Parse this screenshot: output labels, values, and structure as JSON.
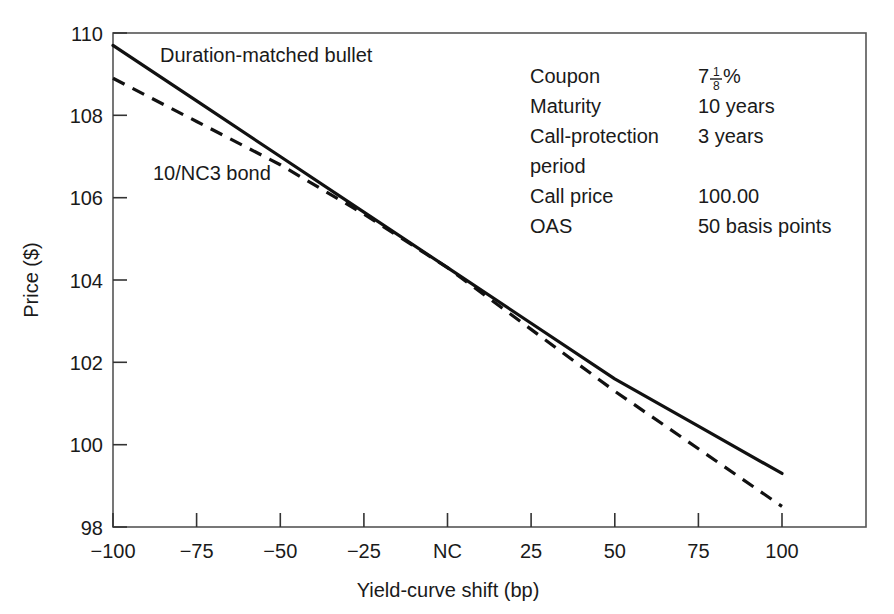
{
  "chart_data": {
    "type": "line",
    "title": "",
    "xlabel": "Yield-curve shift (bp)",
    "ylabel": "Price ($)",
    "xlim": [
      -100,
      100
    ],
    "ylim": [
      98,
      110
    ],
    "grid": false,
    "legend_position": "inline-labels",
    "x_tick_values": [
      -100,
      -75,
      -50,
      -25,
      0,
      25,
      50,
      75,
      100
    ],
    "x_tick_labels": [
      "−100",
      "−75",
      "−50",
      "−25",
      "NC",
      "25",
      "50",
      "75",
      "100"
    ],
    "y_tick_values": [
      98,
      100,
      102,
      104,
      106,
      108,
      110
    ],
    "y_tick_labels": [
      "98",
      "100",
      "102",
      "104",
      "106",
      "108",
      "110"
    ],
    "x": [
      -100,
      -75,
      -50,
      -25,
      0,
      25,
      50,
      75,
      100
    ],
    "series": [
      {
        "name": "Duration-matched bullet",
        "style": "solid",
        "color": "#111111",
        "values": [
          109.7,
          108.35,
          107.0,
          105.65,
          104.3,
          102.95,
          101.6,
          100.45,
          99.3
        ]
      },
      {
        "name": "10/NC3 bond",
        "style": "dashed",
        "color": "#111111",
        "values": [
          108.9,
          107.85,
          106.8,
          105.6,
          104.3,
          102.8,
          101.3,
          99.9,
          98.5
        ]
      }
    ],
    "annotations": [
      {
        "text": "Duration-matched bullet",
        "x": -80,
        "y": 109.4
      },
      {
        "text": "10/NC3 bond",
        "x": -82,
        "y": 106.6
      }
    ]
  },
  "series_labels": {
    "bullet": "Duration-matched bullet",
    "callable": "10/NC3 bond"
  },
  "axes": {
    "y_title": "Price ($)",
    "x_title": "Yield-curve shift (bp)",
    "y_ticks": [
      "110",
      "108",
      "106",
      "104",
      "102",
      "100",
      "98"
    ],
    "x_ticks": [
      "−100",
      "−75",
      "−50",
      "−25",
      "NC",
      "25",
      "50",
      "75",
      "100"
    ]
  },
  "annotation_box": {
    "rows": [
      {
        "label": "Coupon",
        "value": "7",
        "value_kind": "fraction-percent",
        "numerator": "1",
        "denominator": "8",
        "suffix": "%"
      },
      {
        "label": "Maturity",
        "value": "10 years",
        "value_kind": "text"
      },
      {
        "label": "Call-protection",
        "value": "3 years",
        "value_kind": "text"
      },
      {
        "label": "period",
        "value": "",
        "value_kind": "text"
      },
      {
        "label": "Call price",
        "value": "100.00",
        "value_kind": "text"
      },
      {
        "label": "OAS",
        "value": "50 basis points",
        "value_kind": "text"
      }
    ]
  },
  "colors": {
    "ink": "#1a1a1a",
    "line": "#111111",
    "frame": "#555555",
    "background": "#ffffff"
  }
}
